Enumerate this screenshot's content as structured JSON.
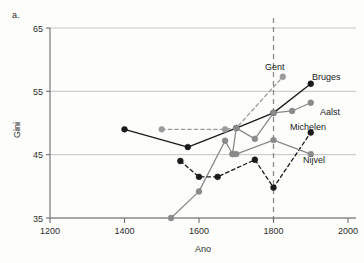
{
  "panel": {
    "letter": "a."
  },
  "chart_data": {
    "type": "line",
    "title": "",
    "subtitle": "",
    "xlabel": "Ano",
    "ylabel": "Gini",
    "xlim": [
      1200,
      2000
    ],
    "ylim": [
      35,
      65
    ],
    "xticks": [
      1200,
      1400,
      1600,
      1800,
      2000
    ],
    "yticks": [
      35,
      45,
      55,
      65
    ],
    "xtick_labels": [
      "1200",
      "1400",
      "1600",
      "1800",
      "2000"
    ],
    "ytick_labels": [
      "35",
      "45",
      "55",
      "65"
    ],
    "grid": "horizontal",
    "legend_position": "inline-labels",
    "annotations": [
      {
        "text": "a.",
        "role": "panel-letter"
      }
    ],
    "reference_lines": [
      {
        "orientation": "vertical",
        "x": 1800,
        "style": "dashed",
        "color": "#8c8c8c"
      }
    ],
    "series": [
      {
        "name": "Bruges",
        "color": "#1a1a1a",
        "line_style": "solid",
        "marker": "filled-circle",
        "label_position": "right",
        "x": [
          1400,
          1570,
          1700,
          1800,
          1900
        ],
        "y": [
          49.0,
          46.2,
          49.2,
          51.6,
          56.2
        ]
      },
      {
        "name": "Gent",
        "color": "#9a9a9a",
        "line_style": "dashed",
        "marker": "filled-circle",
        "label_position": "above-left",
        "x": [
          1500,
          1670,
          1700,
          1825
        ],
        "y": [
          49.0,
          49.0,
          49.2,
          57.3
        ]
      },
      {
        "name": "Aalst",
        "color": "#8a8a8a",
        "line_style": "solid",
        "marker": "filled-circle",
        "label_position": "right",
        "x": [
          1525,
          1600,
          1670,
          1690,
          1700,
          1750,
          1800,
          1850,
          1900
        ],
        "y": [
          35.0,
          39.2,
          47.2,
          45.1,
          49.2,
          47.5,
          51.6,
          51.9,
          53.2
        ]
      },
      {
        "name": "Michelen",
        "color": "#1a1a1a",
        "line_style": "dashed",
        "marker": "filled-circle",
        "label_position": "above",
        "x": [
          1550,
          1600,
          1650,
          1750,
          1800,
          1900
        ],
        "y": [
          44.0,
          41.5,
          41.5,
          44.2,
          39.8,
          48.5
        ]
      },
      {
        "name": "Nijvel",
        "color": "#8a8a8a",
        "line_style": "solid",
        "marker": "filled-circle",
        "label_position": "below-right",
        "x": [
          1690,
          1700,
          1800,
          1900
        ],
        "y": [
          45.1,
          45.1,
          47.3,
          45.1
        ]
      }
    ]
  }
}
